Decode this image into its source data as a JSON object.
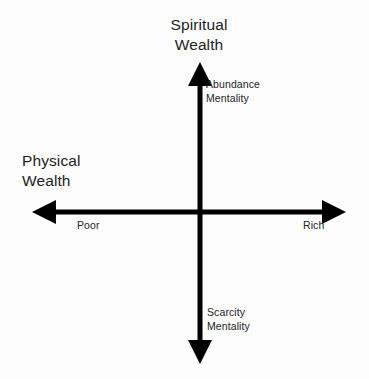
{
  "diagram": {
    "type": "quadrant-axes",
    "background_color": "#fdfdfd",
    "axis_color": "#000000",
    "text_color": "#232323",
    "vertical_axis": {
      "title": "Spiritual\nWealth",
      "positive_label": "Abundance\nMentality",
      "negative_label": "Scarcity\nMentality"
    },
    "horizontal_axis": {
      "title": "Physical\nWealth",
      "negative_label": "Poor",
      "positive_label": "Rich"
    }
  }
}
